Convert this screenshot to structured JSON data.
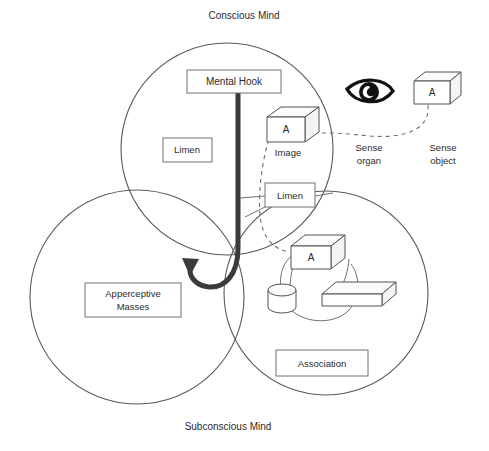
{
  "diagram": {
    "title_top": "Conscious Mind",
    "title_bottom": "Subconscious Mind",
    "boxes": {
      "mental_hook": "Mental Hook",
      "limen_left": "Limen",
      "limen_right": "Limen",
      "apperceptive_masses_line1": "Apperceptive",
      "apperceptive_masses_line2": "Masses",
      "association": "Association"
    },
    "labels": {
      "image": "Image",
      "sense_organ_line1": "Sense",
      "sense_organ_line2": "organ",
      "sense_object_line1": "Sense",
      "sense_object_line2": "object"
    },
    "cube_letters": {
      "image_cube": "A",
      "sense_object_cube": "A",
      "association_cube": "A"
    },
    "icons": {
      "eye": "eye-icon",
      "hook": "hook-icon"
    },
    "colors": {
      "stroke": "#555a5e",
      "text": "#2b2b2b",
      "hook": "#3b3b3b",
      "background": "#ffffff"
    }
  }
}
